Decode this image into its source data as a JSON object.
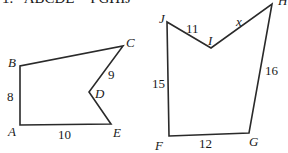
{
  "problem": {
    "number": "1.",
    "statement": "ABCDE ~ FGHIJ"
  },
  "polygons": [
    {
      "name": "ABCDE",
      "vertices": [
        {
          "label": "A",
          "x": 20,
          "y": 125,
          "lx": 8,
          "ly": 136
        },
        {
          "label": "B",
          "x": 20,
          "y": 66,
          "lx": 8,
          "ly": 67
        },
        {
          "label": "C",
          "x": 123,
          "y": 46,
          "lx": 126,
          "ly": 47
        },
        {
          "label": "D",
          "x": 89,
          "y": 92,
          "lx": 95,
          "ly": 98
        },
        {
          "label": "E",
          "x": 111,
          "y": 124,
          "lx": 113,
          "ly": 137
        }
      ],
      "sides": [
        {
          "between": "AB",
          "value": "8",
          "x": 7,
          "y": 101
        },
        {
          "between": "CD",
          "value": "9",
          "x": 108,
          "y": 79
        },
        {
          "between": "AE",
          "value": "10",
          "x": 58,
          "y": 139
        }
      ]
    },
    {
      "name": "FGHIJ",
      "vertices": [
        {
          "label": "F",
          "x": 169,
          "y": 136,
          "lx": 155,
          "ly": 150
        },
        {
          "label": "G",
          "x": 249,
          "y": 133,
          "lx": 249,
          "ly": 146
        },
        {
          "label": "H",
          "x": 272,
          "y": 4,
          "lx": 278,
          "ly": 5
        },
        {
          "label": "I",
          "x": 211,
          "y": 48,
          "lx": 208,
          "ly": 45
        },
        {
          "label": "J",
          "x": 167,
          "y": 22,
          "lx": 159,
          "ly": 23
        }
      ],
      "sides": [
        {
          "between": "FJ",
          "value": "15",
          "x": 152,
          "y": 88
        },
        {
          "between": "IJ",
          "value": "11",
          "x": 186,
          "y": 33
        },
        {
          "between": "HI",
          "value": "x",
          "x": 236,
          "y": 26,
          "variable": true
        },
        {
          "between": "GH",
          "value": "16",
          "x": 265,
          "y": 75
        },
        {
          "between": "FG",
          "value": "12",
          "x": 199,
          "y": 148
        }
      ]
    }
  ]
}
